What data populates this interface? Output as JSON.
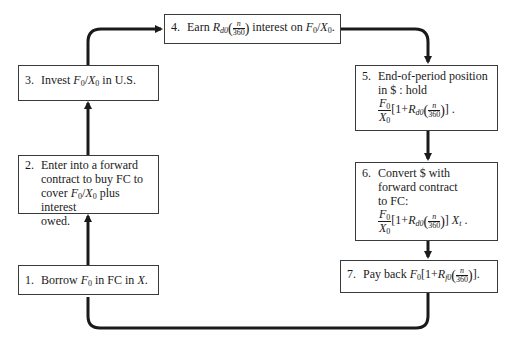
{
  "diagram": {
    "steps": [
      {
        "id": 1,
        "number": "1.",
        "text_parts": [
          "Borrow ",
          "F",
          "0",
          " in FC in ",
          "X",
          "."
        ]
      },
      {
        "id": 2,
        "number": "2.",
        "lines": [
          "Enter into a forward",
          "contract to buy FC to",
          "cover ",
          "F0/X0",
          " plus interest",
          "owed."
        ],
        "line1": "Enter into a forward",
        "line2": "contract to buy FC to",
        "line3_pre": "cover ",
        "line3_post": " plus interest",
        "line4": "owed."
      },
      {
        "id": 3,
        "number": "3.",
        "pre": "Invest ",
        "post": " in U.S."
      },
      {
        "id": 4,
        "number": "4.",
        "pre": "Earn ",
        "mid": " interest  on ",
        "post": "."
      },
      {
        "id": 5,
        "number": "5.",
        "line1": "End-of-period position",
        "line2": "in $ : hold",
        "tail": " ."
      },
      {
        "id": 6,
        "number": "6.",
        "line1": "Convert $ with",
        "line2": "forward contract",
        "line3": "to FC:",
        "tail": " ."
      },
      {
        "id": 7,
        "number": "7.",
        "pre": "Pay back ",
        "tail": "."
      }
    ],
    "symbols": {
      "F": "F",
      "X": "X",
      "zero": "0",
      "R": "R",
      "d0": "d0",
      "f0": "f0",
      "t": "t",
      "n": "n",
      "denom": "360",
      "slash": "/",
      "one_plus": "1+",
      "lbracket": "[",
      "rbracket": "]",
      "lparen": "(",
      "rparen": ")"
    },
    "flow": [
      "1 → 2",
      "2 → 3",
      "3 → 4",
      "4 → 5",
      "5 → 6",
      "6 → 7",
      "7 → 1"
    ],
    "colors": {
      "line": "#1a1a1a",
      "box_border": "#3a3a3a",
      "background": "#ffffff"
    }
  }
}
